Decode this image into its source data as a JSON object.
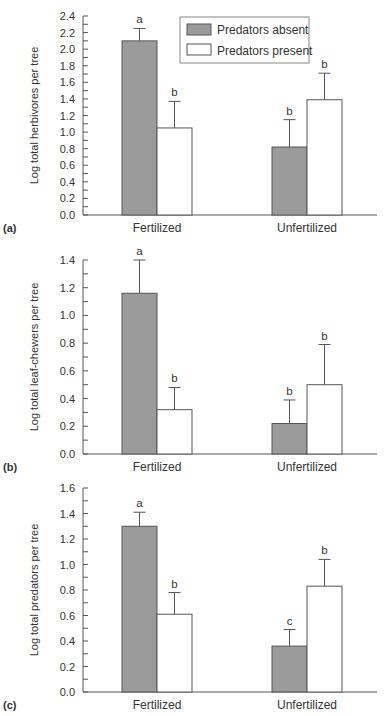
{
  "colors": {
    "absent_fill": "#9b9b9b",
    "present_fill": "#ffffff",
    "stroke": "#555555",
    "text": "#333333"
  },
  "legend": {
    "items": [
      {
        "label": "Predators absent",
        "fill": "#9b9b9b"
      },
      {
        "label": "Predators present",
        "fill": "#ffffff"
      }
    ]
  },
  "chart_data": [
    {
      "type": "bar",
      "panel": "(a)",
      "title": "",
      "xlabel": "",
      "ylabel": "Log total herbivores per tree",
      "ylim": [
        0,
        2.4
      ],
      "yticks": [
        "0.0",
        "0.2",
        "0.4",
        "0.6",
        "0.8",
        "1.0",
        "1.2",
        "1.4",
        "1.6",
        "1.8",
        "2.0",
        "2.2",
        "2.4"
      ],
      "minor_tick_step": 0.1,
      "categories": [
        "Fertilized",
        "Unfertilized"
      ],
      "legend_position": "upper right",
      "grid": false,
      "series": [
        {
          "name": "Predators absent",
          "values": [
            2.1,
            0.82
          ],
          "error_upper": [
            2.25,
            1.15
          ],
          "letters": [
            "a",
            "b"
          ]
        },
        {
          "name": "Predators present",
          "values": [
            1.05,
            1.39
          ],
          "error_upper": [
            1.37,
            1.71
          ],
          "letters": [
            "b",
            "b"
          ]
        }
      ]
    },
    {
      "type": "bar",
      "panel": "(b)",
      "title": "",
      "xlabel": "",
      "ylabel": "Log total leaf-chewers per tree",
      "ylim": [
        0,
        1.4
      ],
      "yticks": [
        "0.0",
        "0.2",
        "0.4",
        "0.6",
        "0.8",
        "1.0",
        "1.2",
        "1.4"
      ],
      "minor_tick_step": 0.1,
      "categories": [
        "Fertilized",
        "Unfertilized"
      ],
      "grid": false,
      "series": [
        {
          "name": "Predators absent",
          "values": [
            1.16,
            0.22
          ],
          "error_upper": [
            1.4,
            0.39
          ],
          "letters": [
            "a",
            "b"
          ]
        },
        {
          "name": "Predators present",
          "values": [
            0.32,
            0.5
          ],
          "error_upper": [
            0.48,
            0.79
          ],
          "letters": [
            "b",
            "b"
          ]
        }
      ]
    },
    {
      "type": "bar",
      "panel": "(c)",
      "title": "",
      "xlabel": "",
      "ylabel": "Log total predators per tree",
      "ylim": [
        0,
        1.6
      ],
      "yticks": [
        "0.0",
        "0.2",
        "0.4",
        "0.6",
        "0.8",
        "1.0",
        "1.2",
        "1.4",
        "1.6"
      ],
      "minor_tick_step": 0.1,
      "categories": [
        "Fertilized",
        "Unfertilized"
      ],
      "grid": false,
      "series": [
        {
          "name": "Predators absent",
          "values": [
            1.3,
            0.36
          ],
          "error_upper": [
            1.41,
            0.49
          ],
          "letters": [
            "a",
            "c"
          ]
        },
        {
          "name": "Predators present",
          "values": [
            0.61,
            0.83
          ],
          "error_upper": [
            0.78,
            1.04
          ],
          "letters": [
            "b",
            "b"
          ]
        }
      ]
    }
  ]
}
